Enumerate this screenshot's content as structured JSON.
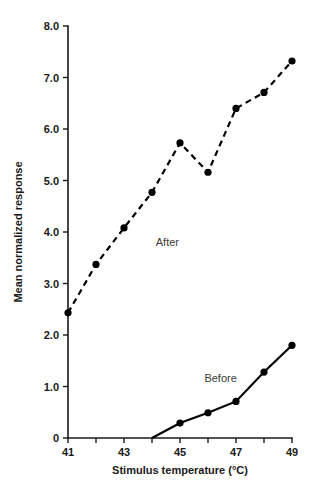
{
  "chart_data": {
    "type": "line",
    "title": "",
    "xlabel": "Stimulus temperature (°C)",
    "ylabel": "Mean normalized response",
    "xlim": [
      41,
      49
    ],
    "ylim": [
      0,
      8.0
    ],
    "grid": false,
    "legend_position": "inline-annotation",
    "x_ticks": [
      41,
      42,
      43,
      44,
      45,
      46,
      47,
      48,
      49
    ],
    "x_tick_labels": [
      "41",
      "",
      "43",
      "",
      "45",
      "",
      "47",
      "",
      "49"
    ],
    "y_ticks": [
      0,
      1.0,
      2.0,
      3.0,
      4.0,
      5.0,
      6.0,
      7.0,
      8.0
    ],
    "y_tick_labels": [
      "0",
      "1.0",
      "2.0",
      "3.0",
      "4.0",
      "5.0",
      "6.0",
      "7.0",
      "8.0"
    ],
    "series": [
      {
        "name": "After",
        "style": "dashed",
        "marker": "filled-circle",
        "color": "#000000",
        "x": [
          41,
          42,
          43,
          44,
          45,
          46,
          47,
          48,
          49
        ],
        "values": [
          2.43,
          3.37,
          4.08,
          4.77,
          5.73,
          5.16,
          6.4,
          6.71,
          7.32
        ]
      },
      {
        "name": "Before",
        "style": "solid",
        "marker": "filled-circle",
        "color": "#000000",
        "x": [
          44,
          45,
          46,
          47,
          48,
          49
        ],
        "values": [
          0.0,
          0.29,
          0.49,
          0.71,
          1.28,
          1.8
        ]
      }
    ],
    "annotations": [
      {
        "text": "After",
        "x": 44.55,
        "y": 3.72
      },
      {
        "text": "Before",
        "x": 46.45,
        "y": 1.08
      }
    ]
  }
}
